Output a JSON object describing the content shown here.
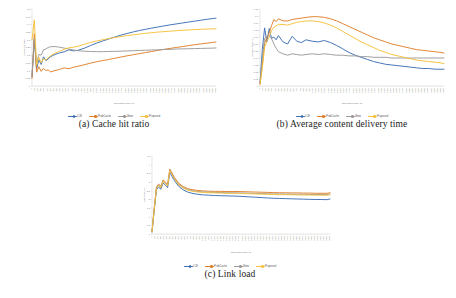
{
  "figure": {
    "background": "#ffffff",
    "panels": [
      {
        "id": "a",
        "caption": "(a) Cache hit ratio"
      },
      {
        "id": "b",
        "caption": "(b) Average content delivery time"
      },
      {
        "id": "c",
        "caption": "(c) Link load"
      }
    ]
  },
  "palette": {
    "blue": "#3d6fb4",
    "orange": "#df7f2a",
    "gray": "#9a9a9a",
    "yellow": "#f5c13b",
    "axis": "#bfbfbf",
    "tick_text": "#808080",
    "caption": "#1b1b1b"
  },
  "chart_data": [
    {
      "type": "line",
      "id": "a",
      "title": "(a) Cache hit ratio",
      "xlabel": "Simulation time (s)",
      "ylabel": "Cache hit ratio",
      "xlim": [
        0,
        3600
      ],
      "ylim": [
        0,
        0.5
      ],
      "yticks": [
        0,
        0.05,
        0.1,
        0.15,
        0.2,
        0.25,
        0.3,
        0.35,
        0.4,
        0.45,
        0.5
      ],
      "ytick_labels": [
        "0",
        "0.05",
        "0.1",
        "0.15",
        "0.2",
        "0.25",
        "0.3",
        "0.35",
        "0.4",
        "0.45",
        "0.5"
      ],
      "grid": false,
      "legend_position": "bottom",
      "x": [
        0,
        45,
        90,
        135,
        180,
        225,
        270,
        315,
        360,
        450,
        540,
        630,
        720,
        810,
        900,
        1020,
        1140,
        1260,
        1380,
        1500,
        1620,
        1740,
        1860,
        1980,
        2100,
        2220,
        2340,
        2460,
        2580,
        2700,
        2820,
        2940,
        3060,
        3180,
        3300,
        3420,
        3540,
        3600
      ],
      "series": [
        {
          "name": "LCE",
          "color": "#3d6fb4",
          "values": [
            0.06,
            0.3,
            0.11,
            0.17,
            0.14,
            0.19,
            0.165,
            0.175,
            0.19,
            0.205,
            0.215,
            0.222,
            0.235,
            0.228,
            0.232,
            0.245,
            0.262,
            0.278,
            0.292,
            0.305,
            0.318,
            0.33,
            0.341,
            0.351,
            0.36,
            0.368,
            0.376,
            0.383,
            0.39,
            0.397,
            0.403,
            0.409,
            0.415,
            0.421,
            0.427,
            0.433,
            0.438,
            0.441
          ]
        },
        {
          "name": "ProbCache",
          "color": "#df7f2a",
          "values": [
            0.05,
            0.34,
            0.09,
            0.125,
            0.095,
            0.115,
            0.1,
            0.105,
            0.092,
            0.1,
            0.108,
            0.118,
            0.112,
            0.122,
            0.128,
            0.138,
            0.148,
            0.157,
            0.165,
            0.172,
            0.18,
            0.188,
            0.196,
            0.203,
            0.21,
            0.217,
            0.224,
            0.231,
            0.238,
            0.244,
            0.25,
            0.256,
            0.262,
            0.268,
            0.273,
            0.278,
            0.283,
            0.286
          ]
        },
        {
          "name": "Betw",
          "color": "#9a9a9a",
          "values": [
            0.07,
            0.31,
            0.145,
            0.205,
            0.2,
            0.235,
            0.24,
            0.25,
            0.255,
            0.256,
            0.252,
            0.246,
            0.24,
            0.234,
            0.229,
            0.226,
            0.224,
            0.223,
            0.223,
            0.224,
            0.225,
            0.226,
            0.228,
            0.229,
            0.231,
            0.232,
            0.234,
            0.235,
            0.237,
            0.238,
            0.24,
            0.241,
            0.242,
            0.243,
            0.244,
            0.245,
            0.246,
            0.247
          ]
        },
        {
          "name": "Proposed",
          "color": "#f5c13b",
          "values": [
            0.3,
            0.43,
            0.135,
            0.185,
            0.15,
            0.178,
            0.168,
            0.183,
            0.196,
            0.213,
            0.226,
            0.238,
            0.248,
            0.252,
            0.258,
            0.27,
            0.282,
            0.292,
            0.3,
            0.308,
            0.315,
            0.321,
            0.327,
            0.332,
            0.337,
            0.342,
            0.346,
            0.35,
            0.353,
            0.356,
            0.359,
            0.362,
            0.364,
            0.366,
            0.368,
            0.37,
            0.371,
            0.372
          ]
        }
      ]
    },
    {
      "type": "line",
      "id": "b",
      "title": "(b) Average content delivery time",
      "xlabel": "Simulation time (s)",
      "ylabel": "Delivery time (s)",
      "xlim": [
        0,
        3600
      ],
      "ylim": [
        0,
        0.11
      ],
      "yticks": [
        0,
        0.01,
        0.02,
        0.03,
        0.04,
        0.05,
        0.06,
        0.07,
        0.08,
        0.09,
        0.1,
        0.11
      ],
      "ytick_labels": [
        "0",
        "0.01",
        "0.02",
        "0.03",
        "0.04",
        "0.05",
        "0.06",
        "0.07",
        "0.08",
        "0.09",
        "0.1",
        "0.11"
      ],
      "grid": false,
      "legend_position": "bottom",
      "x": [
        0,
        45,
        90,
        135,
        180,
        225,
        270,
        315,
        360,
        450,
        540,
        630,
        720,
        810,
        900,
        1020,
        1140,
        1260,
        1380,
        1500,
        1620,
        1740,
        1860,
        1980,
        2100,
        2220,
        2340,
        2460,
        2580,
        2700,
        2820,
        2940,
        3060,
        3180,
        3300,
        3420,
        3540,
        3600
      ],
      "series": [
        {
          "name": "LCE",
          "color": "#3d6fb4",
          "values": [
            0.004,
            0.052,
            0.083,
            0.063,
            0.082,
            0.068,
            0.07,
            0.066,
            0.072,
            0.063,
            0.06,
            0.071,
            0.064,
            0.062,
            0.066,
            0.064,
            0.063,
            0.065,
            0.062,
            0.058,
            0.053,
            0.048,
            0.044,
            0.041,
            0.038,
            0.035,
            0.033,
            0.031,
            0.03,
            0.029,
            0.028,
            0.027,
            0.026,
            0.025,
            0.025,
            0.024,
            0.024,
            0.024
          ]
        },
        {
          "name": "ProbCache",
          "color": "#df7f2a",
          "values": [
            0.003,
            0.03,
            0.061,
            0.069,
            0.076,
            0.086,
            0.095,
            0.092,
            0.096,
            0.093,
            0.093,
            0.095,
            0.096,
            0.097,
            0.098,
            0.099,
            0.099,
            0.098,
            0.096,
            0.093,
            0.089,
            0.085,
            0.081,
            0.077,
            0.073,
            0.069,
            0.066,
            0.063,
            0.06,
            0.058,
            0.056,
            0.054,
            0.052,
            0.051,
            0.05,
            0.049,
            0.048,
            0.047
          ]
        },
        {
          "name": "Betw",
          "color": "#9a9a9a",
          "values": [
            0.004,
            0.04,
            0.068,
            0.071,
            0.072,
            0.068,
            0.06,
            0.054,
            0.049,
            0.046,
            0.044,
            0.046,
            0.045,
            0.044,
            0.045,
            0.046,
            0.045,
            0.046,
            0.045,
            0.044,
            0.044,
            0.043,
            0.043,
            0.042,
            0.042,
            0.041,
            0.041,
            0.041,
            0.04,
            0.04,
            0.04,
            0.04,
            0.04,
            0.04,
            0.04,
            0.04,
            0.04,
            0.04
          ]
        },
        {
          "name": "Proposed",
          "color": "#f5c13b",
          "values": [
            0.002,
            0.025,
            0.055,
            0.064,
            0.07,
            0.079,
            0.084,
            0.086,
            0.088,
            0.088,
            0.087,
            0.089,
            0.091,
            0.092,
            0.093,
            0.093,
            0.092,
            0.09,
            0.087,
            0.083,
            0.078,
            0.073,
            0.068,
            0.063,
            0.059,
            0.055,
            0.051,
            0.048,
            0.045,
            0.043,
            0.041,
            0.039,
            0.037,
            0.036,
            0.035,
            0.034,
            0.033,
            0.032
          ]
        }
      ]
    },
    {
      "type": "line",
      "id": "c",
      "title": "(c) Link load",
      "xlabel": "Simulation time (s)",
      "ylabel": "Link load (%)",
      "xlim": [
        0,
        3600
      ],
      "ylim": [
        0,
        4.5
      ],
      "yticks": [
        0,
        0.5,
        1,
        1.5,
        2,
        2.5,
        3,
        3.5,
        4,
        4.5
      ],
      "ytick_labels": [
        "0",
        "0.5",
        "1",
        "1.5",
        "2",
        "2.5",
        "3",
        "3.5",
        "4",
        "4.5"
      ],
      "grid": false,
      "legend_position": "bottom",
      "x": [
        0,
        45,
        90,
        135,
        180,
        225,
        270,
        315,
        360,
        450,
        540,
        630,
        720,
        810,
        900,
        1020,
        1140,
        1260,
        1380,
        1500,
        1620,
        1740,
        1860,
        1980,
        2100,
        2220,
        2340,
        2460,
        2580,
        2700,
        2820,
        2940,
        3060,
        3180,
        3300,
        3420,
        3540,
        3600
      ],
      "series": [
        {
          "name": "LCE",
          "color": "#3d6fb4",
          "values": [
            0.12,
            1.35,
            2.55,
            2.7,
            2.58,
            2.95,
            2.82,
            2.68,
            3.55,
            3.1,
            2.75,
            2.55,
            2.42,
            2.35,
            2.3,
            2.26,
            2.24,
            2.22,
            2.21,
            2.2,
            2.19,
            2.18,
            2.16,
            2.14,
            2.12,
            2.1,
            2.08,
            2.06,
            2.05,
            2.04,
            2.03,
            2.02,
            2.01,
            2.0,
            1.99,
            1.99,
            1.98,
            2.02
          ]
        },
        {
          "name": "ProbCache",
          "color": "#df7f2a",
          "values": [
            0.14,
            1.5,
            2.72,
            2.88,
            2.76,
            3.12,
            3.0,
            2.86,
            3.75,
            3.28,
            2.93,
            2.74,
            2.62,
            2.56,
            2.52,
            2.49,
            2.47,
            2.46,
            2.46,
            2.45,
            2.45,
            2.45,
            2.44,
            2.43,
            2.42,
            2.41,
            2.4,
            2.39,
            2.38,
            2.38,
            2.37,
            2.37,
            2.36,
            2.36,
            2.35,
            2.35,
            2.35,
            2.38
          ]
        },
        {
          "name": "Betw",
          "color": "#9a9a9a",
          "values": [
            0.13,
            1.45,
            2.66,
            2.82,
            2.7,
            3.06,
            2.94,
            2.8,
            3.69,
            3.22,
            2.87,
            2.68,
            2.56,
            2.5,
            2.46,
            2.43,
            2.41,
            2.4,
            2.39,
            2.38,
            2.38,
            2.37,
            2.36,
            2.35,
            2.34,
            2.33,
            2.32,
            2.31,
            2.31,
            2.3,
            2.3,
            2.29,
            2.29,
            2.28,
            2.28,
            2.28,
            2.27,
            2.3
          ]
        },
        {
          "name": "Proposed",
          "color": "#f5c13b",
          "values": [
            0.13,
            1.43,
            2.63,
            2.79,
            2.67,
            3.03,
            2.91,
            2.77,
            3.66,
            3.19,
            2.84,
            2.65,
            2.53,
            2.47,
            2.43,
            2.4,
            2.38,
            2.37,
            2.36,
            2.35,
            2.35,
            2.34,
            2.33,
            2.32,
            2.31,
            2.3,
            2.29,
            2.28,
            2.27,
            2.27,
            2.26,
            2.26,
            2.25,
            2.25,
            2.24,
            2.24,
            2.24,
            2.27
          ]
        }
      ]
    }
  ],
  "xtick_labels": [
    "0",
    "60",
    "120",
    "180",
    "240",
    "300",
    "360",
    "420",
    "480",
    "540",
    "600",
    "660",
    "720",
    "780",
    "840",
    "900",
    "960",
    "1020",
    "1080",
    "1140",
    "1200",
    "1260",
    "1320",
    "1380",
    "1440",
    "1500",
    "1560",
    "1620",
    "1680",
    "1740",
    "1800",
    "1860",
    "1920",
    "1980",
    "2040",
    "2100",
    "2160",
    "2220",
    "2280",
    "2340",
    "2400",
    "2460",
    "2520",
    "2580",
    "2640",
    "2700",
    "2760",
    "2820",
    "2880",
    "2940",
    "3000",
    "3060",
    "3120",
    "3180",
    "3240",
    "3300",
    "3360",
    "3420",
    "3480",
    "3540"
  ]
}
